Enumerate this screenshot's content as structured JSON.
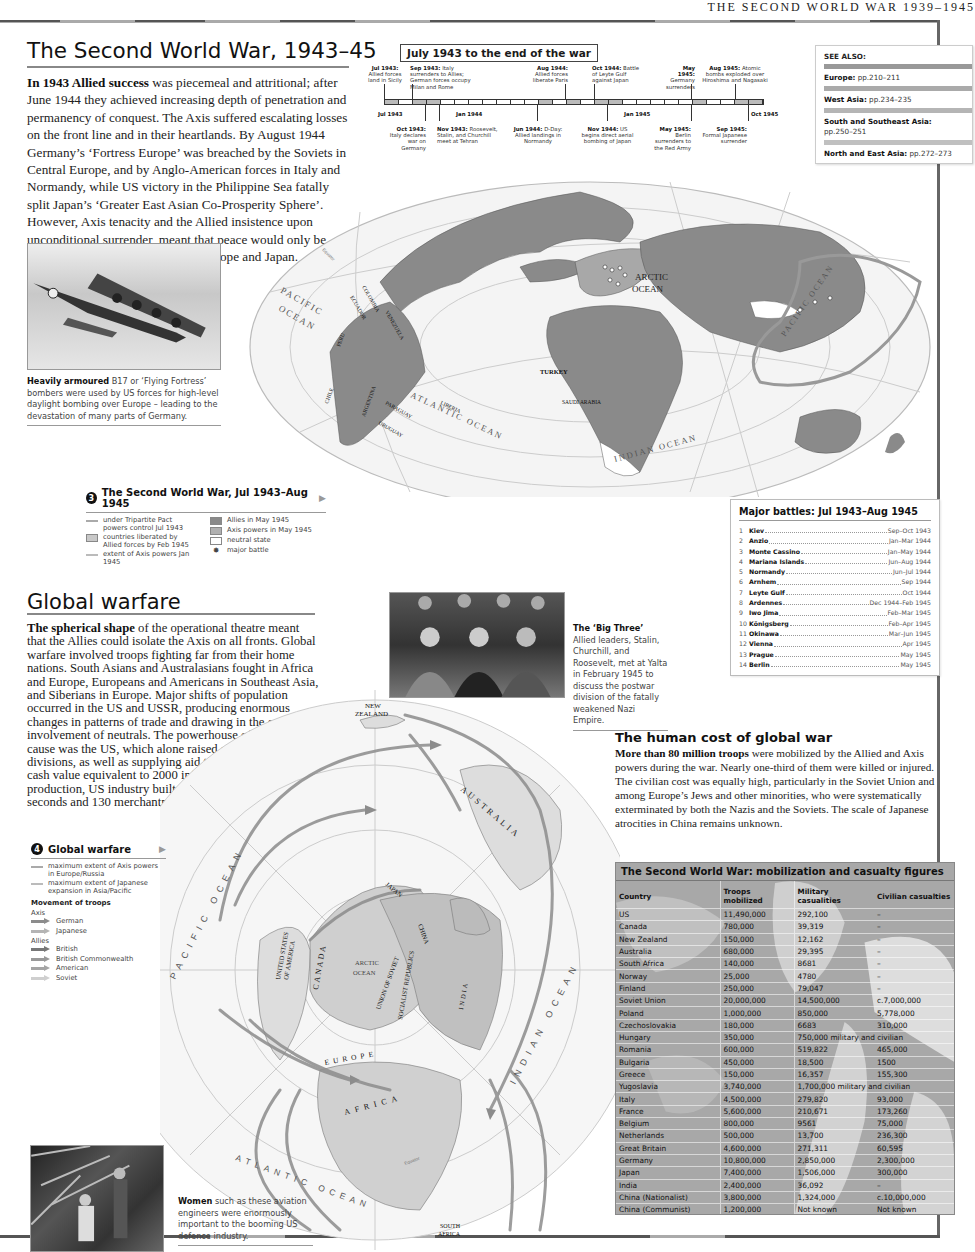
{
  "running_head": "THE SECOND WORLD WAR 1939–1945",
  "section1": {
    "title": "The Second World War, 1943–45",
    "lead": "In 1943 Allied success",
    "body": " was piecemeal and attritional; after June 1944 they achieved increasing depth of penetration and permanency of conquest. The Axis suffered escalating losses on the front line and in their heartlands. By August 1944 Germany’s ‘Fortress Europe’ was breached by the Soviets in Central Europe, and by Anglo-American forces in Italy and Normandy, while US victory in the Philippine Sea fatally split Japan’s ‘Greater East Asian Co-Prosperity Sphere’. However, Axis tenacity and the Allied insistence upon unconditional surrender, meant that peace would only be achieved with the devastation of Europe and Japan."
  },
  "timeline": {
    "title": "July 1943 to the end of the war",
    "axis": [
      "Jul 1943",
      "Jan 1944",
      "Jan 1945",
      "Oct 1945"
    ],
    "above": [
      {
        "date": "Jul 1943:",
        "text": "Allied forces land in Sicily"
      },
      {
        "date": "Sep 1943:",
        "text": "Italy surrenders to Allies; German forces occupy Milan and Rome"
      },
      {
        "date": "Aug 1944:",
        "text": "Allied forces liberate Paris"
      },
      {
        "date": "Oct 1944:",
        "text": "Battle of Leyte Gulf against Japan"
      },
      {
        "date": "May 1945:",
        "text": "Germany surrenders"
      },
      {
        "date": "Aug 1945:",
        "text": "Atomic bombs exploded over Hiroshima and Nagasaki"
      }
    ],
    "below": [
      {
        "date": "Oct 1943:",
        "text": "Italy declares war on Germany"
      },
      {
        "date": "Nov 1943:",
        "text": "Roosevelt, Stalin, and Churchill meet at Tehran"
      },
      {
        "date": "Jun 1944:",
        "text": "D-Day: Allied landings in Normandy"
      },
      {
        "date": "Nov 1944:",
        "text": "US begins direct aerial bombing of Japan"
      },
      {
        "date": "May 1945:",
        "text": "Berlin surrenders to the Red Army"
      },
      {
        "date": "Sep 1945:",
        "text": "Formal Japanese surrender"
      }
    ]
  },
  "see_also": {
    "heading": "SEE ALSO:",
    "items": [
      {
        "region": "Europe:",
        "pages": "pp.210–211"
      },
      {
        "region": "West Asia:",
        "pages": "pp.234–235"
      },
      {
        "region": "South and Southeast Asia:",
        "pages": "pp.250–251"
      },
      {
        "region": "North and East Asia:",
        "pages": "pp.272–273"
      }
    ]
  },
  "captions": {
    "b17": {
      "lead": "Heavily armoured",
      "text": " B17 or ‘Flying Fortress’ bombers were used by US forces for high-level daylight bombing over Europe – leading to the devastation of many parts of Germany."
    },
    "big_three": {
      "lead": "The ‘Big Three’",
      "text": " Allied leaders, Stalin, Churchill, and Roosevelt, met at Yalta in February 1945 to discuss the postwar division of the fatally weakened Nazi Empire."
    },
    "women": {
      "lead": "Women",
      "text": " such as these aviation engineers were enormously important to the booming US defence industry."
    }
  },
  "map3": {
    "labels": {
      "arctic": "ARCTIC",
      "arctic_ocean": "OCEAN",
      "pacific1": "PACIFIC",
      "pacific2": "OCEAN",
      "atlantic": "ATLANTIC OCEAN",
      "indian": "INDIAN OCEAN",
      "pacific_east": "PACIFIC OCEAN",
      "countries": [
        "ECUADOR",
        "COLOMBIA",
        "VENEZUELA",
        "PERU",
        "CHILE",
        "ARGENTINA",
        "PARAGUAY",
        "URUGUAY",
        "LIBERIA",
        "TURKEY",
        "SAUDI ARABIA"
      ],
      "equator": "Equator"
    },
    "legend": {
      "number": "3",
      "title": "The Second World War, Jul 1943–Aug 1945",
      "items_left": [
        {
          "type": "line",
          "label": "under Tripartite Pact powers control Jul 1943"
        },
        {
          "type": "box",
          "label": "countries liberated by Allied forces by Feb 1945"
        },
        {
          "type": "line",
          "label": "extent of Axis powers Jan 1945"
        }
      ],
      "items_right": [
        {
          "type": "box",
          "color": "#8a8a8a",
          "label": "Allies in May 1945"
        },
        {
          "type": "box",
          "color": "#b0b0b0",
          "label": "Axis powers in May 1945"
        },
        {
          "type": "box",
          "color": "#ffffff",
          "label": "neutral state"
        },
        {
          "type": "icon",
          "label": "major battle"
        }
      ]
    }
  },
  "battles": {
    "title": "Major battles: Jul 1943–Aug 1945",
    "rows": [
      {
        "n": "1",
        "name": "Kiev",
        "date": "Sep–Oct 1943"
      },
      {
        "n": "2",
        "name": "Anzio",
        "date": "Jan–Mar 1944"
      },
      {
        "n": "3",
        "name": "Monte Cassino",
        "date": "Jan–May 1944"
      },
      {
        "n": "4",
        "name": "Mariana Islands",
        "date": "Jun–Aug 1944"
      },
      {
        "n": "5",
        "name": "Normandy",
        "date": "Jun–Jul 1944"
      },
      {
        "n": "6",
        "name": "Arnhem",
        "date": "Sep 1944"
      },
      {
        "n": "7",
        "name": "Leyte Gulf",
        "date": "Oct 1944"
      },
      {
        "n": "8",
        "name": "Ardennes",
        "date": "Dec 1944–Feb 1945"
      },
      {
        "n": "9",
        "name": "Iwo Jima",
        "date": "Feb–Mar 1945"
      },
      {
        "n": "10",
        "name": "Königsberg",
        "date": "Feb–Apr 1945"
      },
      {
        "n": "11",
        "name": "Okinawa",
        "date": "Mar–Jun 1945"
      },
      {
        "n": "12",
        "name": "Vienna",
        "date": "Apr 1945"
      },
      {
        "n": "13",
        "name": "Prague",
        "date": "May 1945"
      },
      {
        "n": "14",
        "name": "Berlin",
        "date": "May 1945"
      }
    ]
  },
  "section2": {
    "title": "Global warfare",
    "lead": "The spherical shape",
    "body": " of the operational theatre meant that the Allies could isolate the Axis on all fronts. Global warfare involved troops fighting far from their home nations. South Asians and Australasians fought in Africa and Europe, Europeans and Americans in Southeast Asia, and Siberians in Europe. Major shifts of population occurred in the US and USSR, producing enormous changes in patterns of trade and drawing in the economic involvement of neutrals. The powerhouse of the Allied cause was the US, which alone raised a hundred military divisions, as well as supplying aid to her allies with a cash value equivalent to 2000 infantry divisions. At peak production, US industry built an aircraft every 294 seconds and 130 merchantmen in a single month."
  },
  "map4": {
    "labels": {
      "new_zealand1": "NEW",
      "new_zealand2": "ZEALAND",
      "australia": "AUSTRALIA",
      "pacific": "PACIFIC OCEAN",
      "japan": "JAPAN",
      "china": "CHINA",
      "usa1": "UNITED STATES",
      "usa2": "OF AMERICA",
      "canada": "CANADA",
      "arctic1": "ARCTIC",
      "arctic2": "OCEAN",
      "ussr1": "UNION OF SOVIET",
      "ussr2": "SOCIALIST REPUBLICS",
      "india": "INDIA",
      "indian": "INDIAN OCEAN",
      "europe": "EUROPE",
      "africa": "AFRICA",
      "atlantic": "ATLANTIC OCEAN",
      "south_africa1": "SOUTH",
      "south_africa2": "AFRICA",
      "equator": "Equator"
    },
    "legend": {
      "number": "4",
      "title": "Global warfare",
      "lines": [
        {
          "label": "maximum extent of Axis powers in Europe/Russia"
        },
        {
          "label": "maximum extent of Japanese expansion in Asia/Pacific"
        }
      ],
      "movement_title": "Movement of troops",
      "axis_label": "Axis",
      "axis": [
        {
          "label": "German",
          "color": "#8c8c8c"
        },
        {
          "label": "Japanese",
          "color": "#b4b4b4"
        }
      ],
      "allies_label": "Allies",
      "allies": [
        {
          "label": "British",
          "color": "#777777"
        },
        {
          "label": "British Commonwealth",
          "color": "#999999"
        },
        {
          "label": "American",
          "color": "#a5a5a5"
        },
        {
          "label": "Soviet",
          "color": "#cfcfcf"
        }
      ]
    }
  },
  "section3": {
    "title": "The human cost of global war",
    "lead": "More than 80 million troops",
    "body": " were mobilized by the Allied and Axis powers during the war. Nearly one-third of them were killed or injured. The civilian cost was equally high, particularly in the Soviet Union and among Europe’s Jews and other minorities, who were systematically exterminated by both the Nazis and the Soviets. The scale of Japanese atrocities in China remains unknown."
  },
  "casualty_table": {
    "title": "The Second World War: mobilization and casualty figures",
    "columns": [
      "Country",
      "Troops mobilized",
      "Military casualities",
      "Civilian casualties"
    ],
    "rows": [
      {
        "country": "US",
        "troops": "11,490,000",
        "military": "292,100",
        "civilian": "–"
      },
      {
        "country": "Canada",
        "troops": "780,000",
        "military": "39,319",
        "civilian": "–"
      },
      {
        "country": "New Zealand",
        "troops": "150,000",
        "military": "12,162",
        "civilian": "–"
      },
      {
        "country": "Australia",
        "troops": "680,000",
        "military": "29,395",
        "civilian": "–"
      },
      {
        "country": "South Africa",
        "troops": "140,000",
        "military": "8681",
        "civilian": "–"
      },
      {
        "country": "Norway",
        "troops": "25,000",
        "military": "4780",
        "civilian": "–"
      },
      {
        "country": "Finland",
        "troops": "250,000",
        "military": "79,047",
        "civilian": "–"
      },
      {
        "country": "Soviet Union",
        "troops": "20,000,000",
        "military": "14,500,000",
        "civilian": "c.7,000,000"
      },
      {
        "country": "Poland",
        "troops": "1,000,000",
        "military": "850,000",
        "civilian": "5,778,000"
      },
      {
        "country": "Czechoslovakia",
        "troops": "180,000",
        "military": "6683",
        "civilian": "310,000"
      },
      {
        "country": "Hungary",
        "troops": "350,000",
        "combined": "750,000 military and civilian"
      },
      {
        "country": "Romania",
        "troops": "600,000",
        "military": "519,822",
        "civilian": "465,000"
      },
      {
        "country": "Bulgaria",
        "troops": "450,000",
        "military": "18,500",
        "civilian": "1500"
      },
      {
        "country": "Greece",
        "troops": "150,000",
        "military": "16,357",
        "civilian": "155,300"
      },
      {
        "country": "Yugoslavia",
        "troops": "3,740,000",
        "combined": "1,700,000 military and civilian"
      },
      {
        "country": "Italy",
        "troops": "4,500,000",
        "military": "279,820",
        "civilian": "93,000"
      },
      {
        "country": "France",
        "troops": "5,600,000",
        "military": "210,671",
        "civilian": "173,260"
      },
      {
        "country": "Belgium",
        "troops": "800,000",
        "military": "9561",
        "civilian": "75,000"
      },
      {
        "country": "Netherlands",
        "troops": "500,000",
        "military": "13,700",
        "civilian": "236,300"
      },
      {
        "country": "Great Britain",
        "troops": "4,600,000",
        "military": "271,311",
        "civilian": "60,595"
      },
      {
        "country": "Germany",
        "troops": "10,800,000",
        "military": "2,850,000",
        "civilian": "2,300,000"
      },
      {
        "country": "Japan",
        "troops": "7,400,000",
        "military": "1,506,000",
        "civilian": "300,000"
      },
      {
        "country": "India",
        "troops": "2,400,000",
        "military": "36,092",
        "civilian": "–"
      },
      {
        "country": "China (Nationalist)",
        "troops": "3,800,000",
        "military": "1,324,000",
        "civilian": "c.10,000,000"
      },
      {
        "country": "China (Communist)",
        "troops": "1,200,000",
        "military": "Not known",
        "civilian": "Not known"
      },
      {
        "country": "Denmark",
        "troops": "Not known",
        "military": "4339",
        "civilian": "–"
      },
      {
        "country": "Spain",
        "troops": "Not known",
        "combined": "23,000 military and civilian"
      }
    ]
  },
  "colors": {
    "land_allied": "#8a8a8a",
    "land_axis": "#b0b0b0",
    "ocean": "#f2f2f2",
    "rule": "#555555",
    "table_bg": "#a8a8a8"
  }
}
